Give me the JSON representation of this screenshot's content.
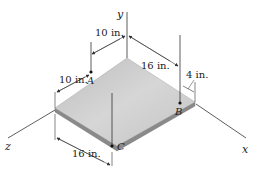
{
  "figure": {
    "axes": {
      "x": "x",
      "y": "y",
      "z": "z"
    },
    "points": {
      "A": "A",
      "B": "B",
      "C": "C"
    },
    "dimensions": {
      "a_from_back_edge": "10 in.",
      "a_from_left_edge": "10 in.",
      "b_from_back_edge": "16 in.",
      "b_from_right_edge": "4 in.",
      "c_from_left_corner": "16 in."
    },
    "colors": {
      "plate_top": "#c8c8c8",
      "plate_edge": "#8a8a8a",
      "line": "#333333"
    }
  }
}
